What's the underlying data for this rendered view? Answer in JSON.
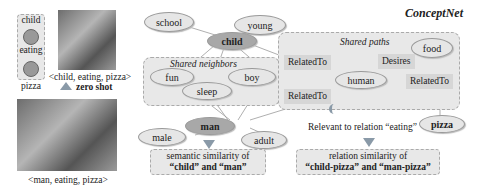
{
  "header": {
    "title": "ConceptNet"
  },
  "left_panel": {
    "triple_nodes": [
      "child",
      "eating",
      "pizza"
    ],
    "top_caption": "<child, eating, pizza>",
    "zero_shot_label": "zero shot",
    "bottom_caption": "<man, eating, pizza>"
  },
  "graph": {
    "nodes": {
      "school": "school",
      "young": "young",
      "child": "child",
      "fun": "fun",
      "boy": "boy",
      "sleep": "sleep",
      "man": "man",
      "male": "male",
      "adult": "adult",
      "human": "human",
      "food": "food",
      "pizza": "pizza"
    },
    "relations": {
      "rel1": "RelatedTo",
      "rel2": "RelatedTo",
      "rel3": "Desires",
      "rel4": "RelatedTo"
    },
    "shared_neighbors_title": "Shared neighbors",
    "shared_paths_title": "Shared paths",
    "relevant_text": "Relevant to relation “eating”"
  },
  "results": {
    "semantic_line1": "semantic similarity of",
    "semantic_line2": "“child” and “man”",
    "relation_line1": "relation similarity of",
    "relation_line2": "“child-pizza” and “man-pizza”"
  },
  "colors": {
    "node_fill": "#e6e6e6",
    "node_dark": "#a8a8a8",
    "box_fill": "#e8e8e8",
    "relation_fill": "#d6d6d6"
  }
}
